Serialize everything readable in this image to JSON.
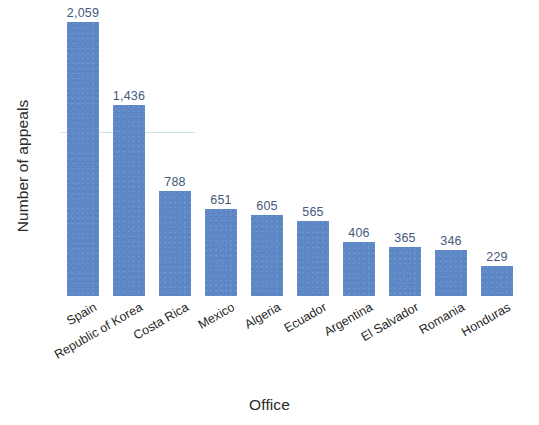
{
  "chart_data": {
    "type": "bar",
    "title": "",
    "subtitle": "",
    "xlabel": "Office",
    "ylabel": "Number of appeals",
    "categories": [
      "Spain",
      "Republic of Korea",
      "Costa Rica",
      "Mexico",
      "Algeria",
      "Ecuador",
      "Argentina",
      "El Salvador",
      "Romania",
      "Honduras"
    ],
    "values": [
      2059,
      1436,
      788,
      651,
      605,
      565,
      406,
      365,
      346,
      229
    ],
    "value_labels": [
      "2,059",
      "1,436",
      "788",
      "651",
      "605",
      "565",
      "406",
      "365",
      "346",
      "229"
    ],
    "ylim": [
      0,
      2059
    ],
    "grid": false,
    "legend": null,
    "legend_position": "none",
    "bar_color": "#5e87c6",
    "value_label_color": "#44597d",
    "axis_text_color": "#2b2b2b",
    "background_color": "#ffffff",
    "tick_label_rotation_deg": -30,
    "y_axis_ticks_shown": false,
    "axis_lines_shown": false
  }
}
